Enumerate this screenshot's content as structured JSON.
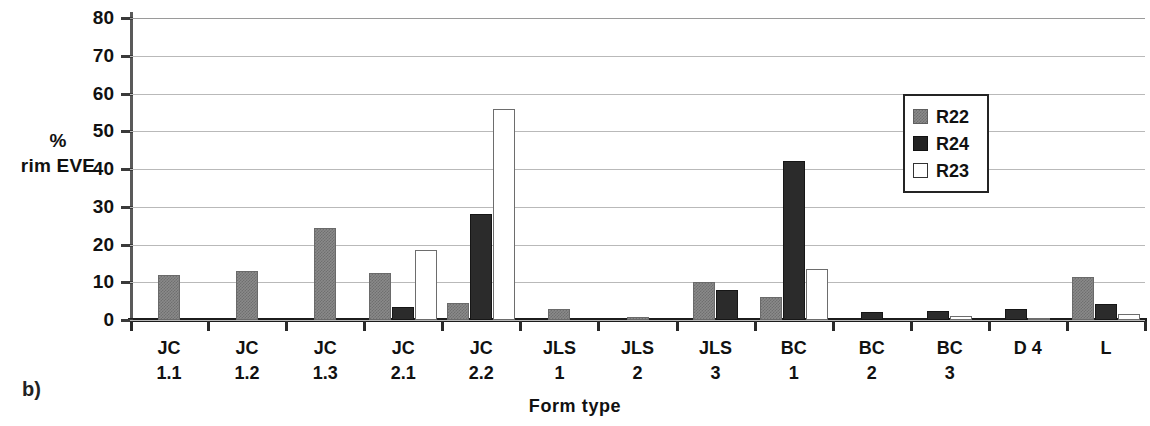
{
  "figure": {
    "panel_label": "b)"
  },
  "chart_data": {
    "type": "bar",
    "title": "",
    "xlabel": "Form type",
    "ylabel": "% rim EVE",
    "ylabel_lines": [
      "%",
      "rim EVE"
    ],
    "ylim": [
      0,
      80
    ],
    "ytick_step": 10,
    "yticks": [
      80,
      70,
      60,
      50,
      40,
      30,
      20,
      10,
      0
    ],
    "grid": true,
    "grid_axis": "y",
    "legend_position": "top-right",
    "categories": [
      "JC 1.1",
      "JC 1.2",
      "JC 1.3",
      "JC 2.1",
      "JC 2.2",
      "JLS 1",
      "JLS 2",
      "JLS 3",
      "BC 1",
      "BC 2",
      "BC 3",
      "D 4",
      "L"
    ],
    "category_lines": [
      [
        "JC",
        "1.1"
      ],
      [
        "JC",
        "1.2"
      ],
      [
        "JC",
        "1.3"
      ],
      [
        "JC",
        "2.1"
      ],
      [
        "JC",
        "2.2"
      ],
      [
        "JLS",
        "1"
      ],
      [
        "JLS",
        "2"
      ],
      [
        "JLS",
        "3"
      ],
      [
        "BC",
        "1"
      ],
      [
        "BC",
        "2"
      ],
      [
        "BC",
        "3"
      ],
      [
        "D 4",
        ""
      ],
      [
        "L",
        ""
      ]
    ],
    "series": [
      {
        "name": "R22",
        "color": "#8a8a8a",
        "style": "gray-hatch",
        "values": [
          12.0,
          13.0,
          24.5,
          12.5,
          4.5,
          3.0,
          0.7,
          10.0,
          6.0,
          0,
          0,
          0,
          11.5
        ]
      },
      {
        "name": "R24",
        "color": "#2b2b2b",
        "style": "solid-black",
        "values": [
          0,
          0,
          0,
          3.5,
          28.0,
          0,
          0,
          8.0,
          42.0,
          2.0,
          2.5,
          3.0,
          4.3
        ]
      },
      {
        "name": "R23",
        "color": "#ffffff",
        "style": "white-outline",
        "values": [
          0,
          0,
          0,
          18.5,
          56.0,
          0,
          0,
          0,
          13.5,
          0,
          1.0,
          0.5,
          1.5
        ]
      }
    ]
  },
  "legend": {
    "items": [
      {
        "label": "R22",
        "swatch": "r22"
      },
      {
        "label": "R24",
        "swatch": "r24"
      },
      {
        "label": "R23",
        "swatch": "r23"
      }
    ]
  }
}
